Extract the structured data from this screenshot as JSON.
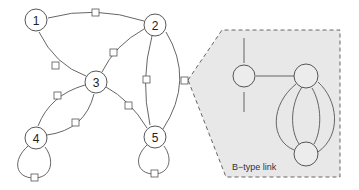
{
  "diagram": {
    "type": "directed graph with link nodes",
    "nodes": [
      {
        "id": "1",
        "label": "1",
        "x": 36,
        "y": 20
      },
      {
        "id": "2",
        "label": "2",
        "x": 155,
        "y": 25
      },
      {
        "id": "3",
        "label": "3",
        "x": 96,
        "y": 82
      },
      {
        "id": "4",
        "label": "4",
        "x": 36,
        "y": 138
      },
      {
        "id": "5",
        "label": "5",
        "x": 155,
        "y": 137
      }
    ],
    "edges": [
      {
        "from": "2",
        "to": "1"
      },
      {
        "from": "3",
        "to": "1"
      },
      {
        "from": "3",
        "to": "2"
      },
      {
        "from": "3",
        "to": "4"
      },
      {
        "from": "4",
        "to": "3"
      },
      {
        "from": "5",
        "to": "3"
      },
      {
        "from": "2",
        "to": "5"
      },
      {
        "from": "5",
        "to": "2"
      },
      {
        "from": "4",
        "to": "4",
        "self_loop": true
      },
      {
        "from": "5",
        "to": "5",
        "self_loop": true
      }
    ],
    "callout": {
      "caption": "B−type link",
      "fill_color": "#e8e8e8",
      "border": "dashed"
    },
    "colors": {
      "line": "#555555",
      "node_fill": "#ffffff",
      "callout_fill": "#e8e8e8"
    }
  }
}
